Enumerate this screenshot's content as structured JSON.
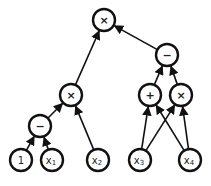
{
  "diagram": {
    "type": "computation-graph",
    "colors": {
      "stroke": "#111111",
      "fill": "#ffffff",
      "text": "#222222"
    },
    "radius": 11,
    "nodes": [
      {
        "id": "root",
        "label": "×",
        "kind": "op",
        "x": 104,
        "y": 20
      },
      {
        "id": "sub_r",
        "label": "−",
        "kind": "op",
        "x": 167,
        "y": 55
      },
      {
        "id": "mul_m",
        "label": "×",
        "kind": "op",
        "x": 71,
        "y": 95
      },
      {
        "id": "add",
        "label": "+",
        "kind": "op",
        "x": 150,
        "y": 95
      },
      {
        "id": "mul_r",
        "label": "×",
        "kind": "op",
        "x": 181,
        "y": 95
      },
      {
        "id": "sub_l",
        "label": "−",
        "kind": "op",
        "x": 40,
        "y": 126
      },
      {
        "id": "one",
        "label": "1",
        "kind": "leaf",
        "x": 21,
        "y": 160
      },
      {
        "id": "x1",
        "label": "x",
        "sub": "1",
        "kind": "leaf",
        "x": 52,
        "y": 160
      },
      {
        "id": "x2",
        "label": "x",
        "sub": "2",
        "kind": "leaf",
        "x": 98,
        "y": 160
      },
      {
        "id": "x3",
        "label": "x",
        "sub": "3",
        "kind": "leaf",
        "x": 140,
        "y": 160
      },
      {
        "id": "x4",
        "label": "x",
        "sub": "4",
        "kind": "leaf",
        "x": 190,
        "y": 160
      }
    ],
    "edges": [
      [
        "mul_m",
        "root"
      ],
      [
        "sub_r",
        "root"
      ],
      [
        "sub_l",
        "mul_m"
      ],
      [
        "x2",
        "mul_m"
      ],
      [
        "one",
        "sub_l"
      ],
      [
        "x1",
        "sub_l"
      ],
      [
        "add",
        "sub_r"
      ],
      [
        "mul_r",
        "sub_r"
      ],
      [
        "x3",
        "add"
      ],
      [
        "x4",
        "add"
      ],
      [
        "x3",
        "mul_r"
      ],
      [
        "x4",
        "mul_r"
      ]
    ]
  }
}
